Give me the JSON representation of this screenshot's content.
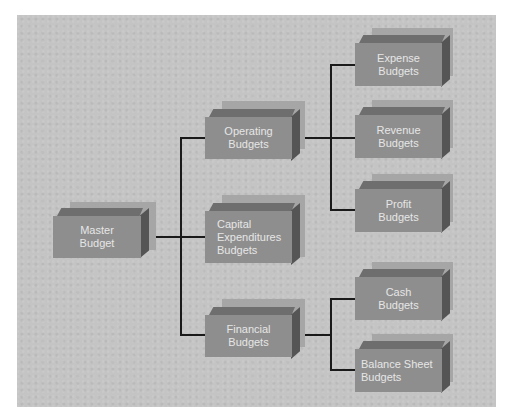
{
  "diagram": {
    "type": "hierarchy",
    "colors": {
      "background": "#ffffff",
      "panel": "#c4c4c4",
      "box_face": "#8e8e8e",
      "box_top": "#6e6e6e",
      "box_side": "#555555",
      "box_shadow": "#a6a6a6",
      "text": "#e6e6e6",
      "connector": "#1a1a1a"
    },
    "nodes": {
      "master": {
        "lines": [
          "Master",
          "Budget"
        ]
      },
      "operating": {
        "lines": [
          "Operating",
          "Budgets"
        ]
      },
      "capital": {
        "lines": [
          "Capital",
          "Expenditures",
          "Budgets"
        ]
      },
      "financial": {
        "lines": [
          "Financial",
          "Budgets"
        ]
      },
      "expense": {
        "lines": [
          "Expense",
          "Budgets"
        ]
      },
      "revenue": {
        "lines": [
          "Revenue",
          "Budgets"
        ]
      },
      "profit": {
        "lines": [
          "Profit",
          "Budgets"
        ]
      },
      "cash": {
        "lines": [
          "Cash",
          "Budgets"
        ]
      },
      "balance_sheet": {
        "lines": [
          "Balance Sheet",
          "Budgets"
        ]
      }
    },
    "edges": [
      [
        "Master Budget",
        "Operating Budgets"
      ],
      [
        "Master Budget",
        "Capital Expenditures Budgets"
      ],
      [
        "Master Budget",
        "Financial Budgets"
      ],
      [
        "Operating Budgets",
        "Expense Budgets"
      ],
      [
        "Operating Budgets",
        "Revenue Budgets"
      ],
      [
        "Operating Budgets",
        "Profit Budgets"
      ],
      [
        "Financial Budgets",
        "Cash Budgets"
      ],
      [
        "Financial Budgets",
        "Balance Sheet Budgets"
      ]
    ]
  }
}
